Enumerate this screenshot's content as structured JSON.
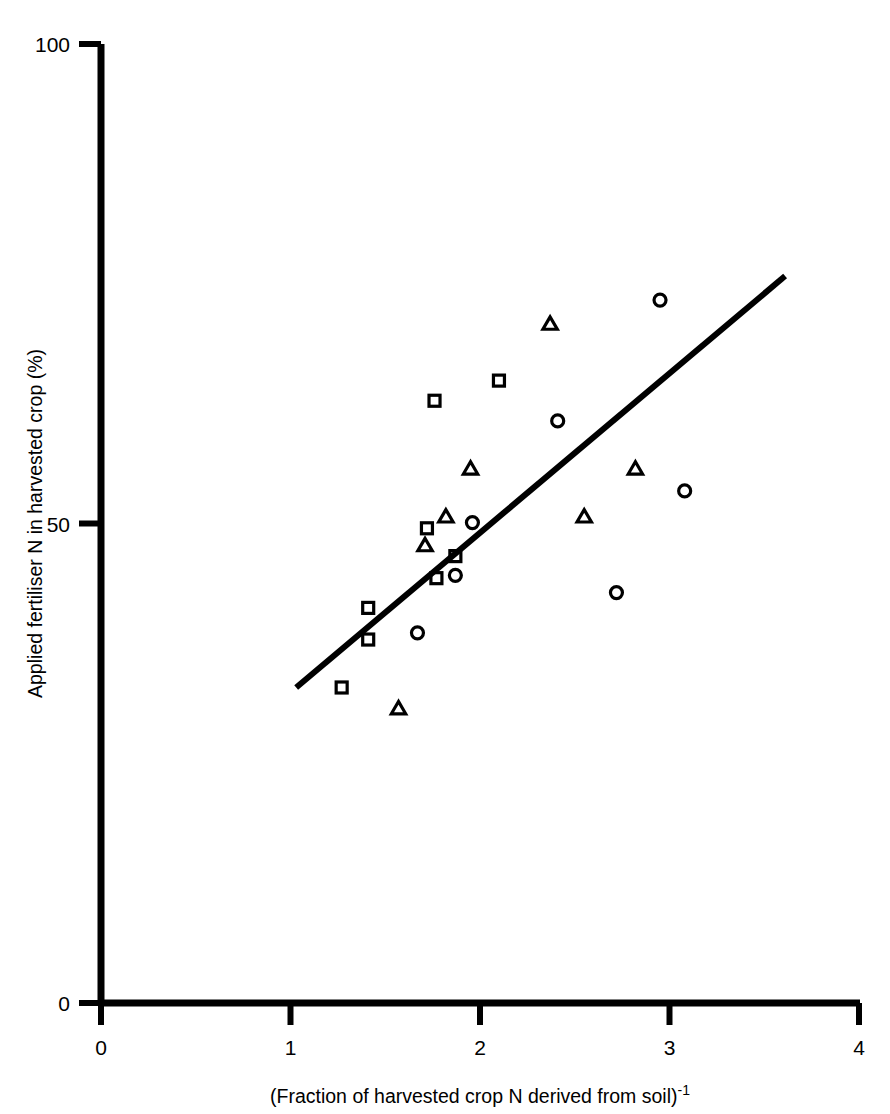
{
  "figure": {
    "background_color": "#ffffff",
    "ink_color": "#000000"
  },
  "chart_data": {
    "type": "scatter",
    "title": "",
    "subtitle": "",
    "xlabel": "(Fraction of harvested crop N derived from soil)-1",
    "xlabel_base": "(Fraction of harvested crop N derived from soil)",
    "xlabel_exponent": "-1",
    "ylabel": "Applied fertiliser N in harvested crop (%)",
    "xlim": [
      0,
      4
    ],
    "ylim": [
      0,
      100
    ],
    "xticks": [
      0,
      1,
      2,
      3,
      4
    ],
    "xtick_labels": [
      "0",
      "1",
      "2",
      "3",
      "4"
    ],
    "yticks": [
      0,
      50,
      100
    ],
    "ytick_labels": [
      "0",
      "50",
      "100"
    ],
    "grid": false,
    "legend": "none",
    "legend_position": "none",
    "series": [
      {
        "name": "circles",
        "marker": "circle",
        "marker_size": 13,
        "filled": false,
        "points": [
          {
            "x": 1.67,
            "y": 38.6
          },
          {
            "x": 1.87,
            "y": 44.6
          },
          {
            "x": 1.96,
            "y": 50.1
          },
          {
            "x": 2.41,
            "y": 60.7
          },
          {
            "x": 2.72,
            "y": 42.8
          },
          {
            "x": 2.95,
            "y": 73.3
          },
          {
            "x": 3.08,
            "y": 53.4
          }
        ]
      },
      {
        "name": "triangles",
        "marker": "triangle",
        "marker_size": 13,
        "filled": false,
        "points": [
          {
            "x": 1.57,
            "y": 30.8
          },
          {
            "x": 1.71,
            "y": 47.8
          },
          {
            "x": 1.82,
            "y": 50.8
          },
          {
            "x": 1.95,
            "y": 55.8
          },
          {
            "x": 2.37,
            "y": 70.9
          },
          {
            "x": 2.55,
            "y": 50.8
          },
          {
            "x": 2.82,
            "y": 55.8
          }
        ]
      },
      {
        "name": "squares",
        "marker": "square",
        "marker_size": 13,
        "filled": false,
        "points": [
          {
            "x": 1.27,
            "y": 32.9
          },
          {
            "x": 1.41,
            "y": 37.9
          },
          {
            "x": 1.41,
            "y": 41.2
          },
          {
            "x": 1.72,
            "y": 49.5
          },
          {
            "x": 1.76,
            "y": 62.8
          },
          {
            "x": 1.77,
            "y": 44.3
          },
          {
            "x": 1.87,
            "y": 46.6
          },
          {
            "x": 2.1,
            "y": 64.9
          }
        ]
      }
    ],
    "fit_line": {
      "name": "regression-line",
      "x_start": 1.03,
      "y_start": 32.9,
      "x_end": 3.61,
      "y_end": 75.8,
      "stroke_width": 6
    }
  }
}
